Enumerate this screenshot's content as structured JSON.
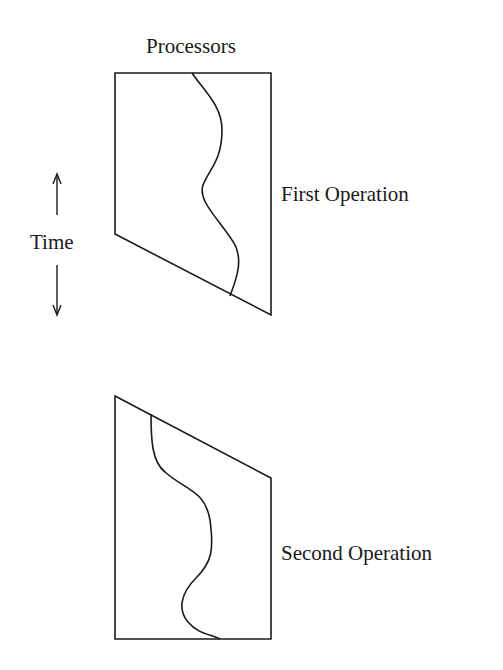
{
  "diagram": {
    "top_label": "Processors",
    "time_label": "Time",
    "first_operation_label": "First Operation",
    "second_operation_label": "Second Operation",
    "stroke_color": "#1a1a1a",
    "background_color": "#ffffff"
  }
}
